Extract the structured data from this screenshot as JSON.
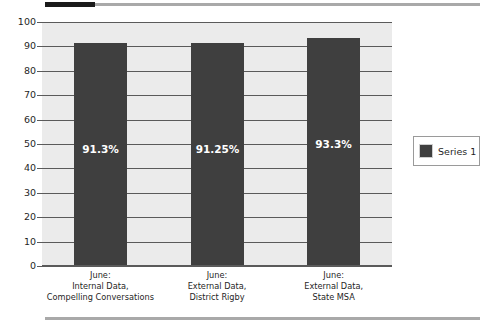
{
  "chart_data": {
    "type": "bar",
    "title": "",
    "xlabel": "",
    "ylabel": "",
    "ylim": [
      0,
      100
    ],
    "ytick_step": 10,
    "grid": true,
    "legend_position": "right",
    "categories": [
      "June:\nInternal Data,\nCompelling Conversations",
      "June:\nExternal Data,\nDistrict Rigby",
      "June:\nExternal Data,\nState MSA"
    ],
    "category_lines": [
      [
        "June:",
        "Internal Data,",
        "Compelling Conversations"
      ],
      [
        "June:",
        "External Data,",
        "District Rigby"
      ],
      [
        "June:",
        "External Data,",
        "State MSA"
      ]
    ],
    "values": [
      91.3,
      91.25,
      93.3
    ],
    "data_labels": [
      "91.3%",
      "91.25%",
      "93.3%"
    ],
    "ytick_labels": [
      "100",
      "90",
      "80",
      "70",
      "60",
      "50",
      "40",
      "30",
      "20",
      "10",
      "0"
    ],
    "series": [
      {
        "name": "Series 1",
        "values": [
          91.3,
          91.25,
          93.3
        ],
        "color": "#3f3f3f"
      }
    ],
    "legend": [
      "Series 1"
    ],
    "colors": {
      "bar": "#3f3f3f",
      "plot_background": "#ebebeb",
      "gridline": "#5a5a5a",
      "data_label": "#ffffff",
      "axis_text": "#1f1f1f",
      "rule_dark": "#1a1a1a",
      "rule_light": "#a9a9a9"
    }
  }
}
